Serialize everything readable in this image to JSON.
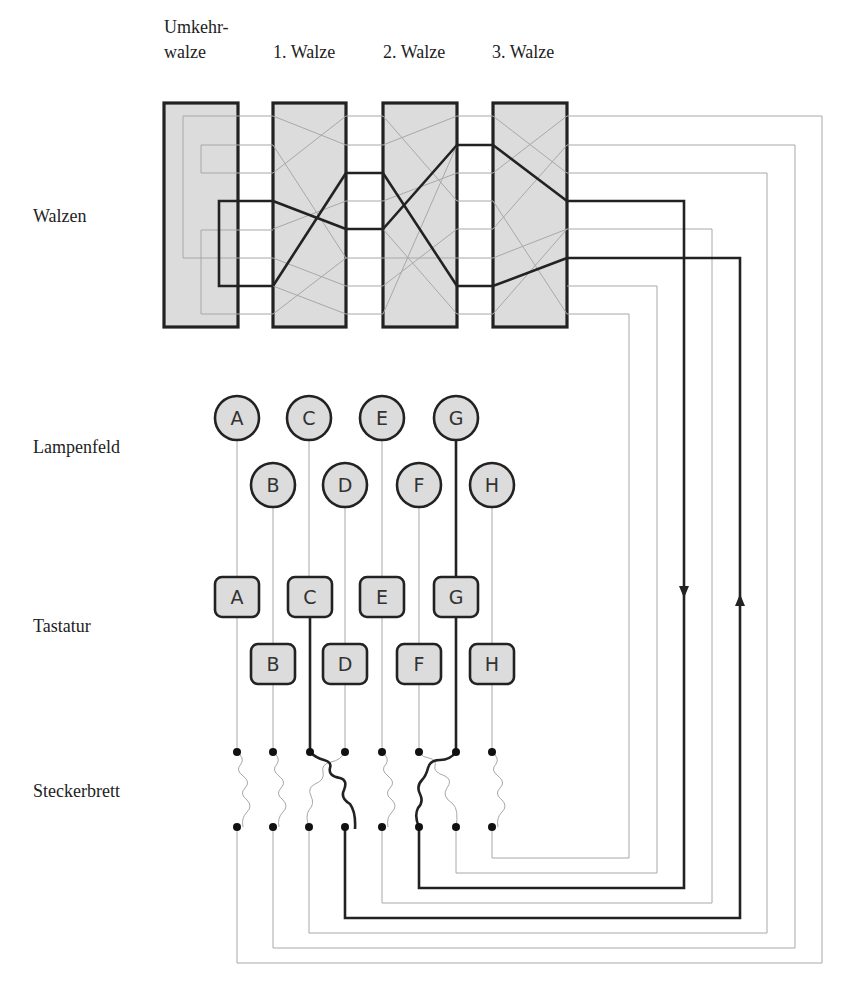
{
  "labels": {
    "reflector_line1": "Umkehr-",
    "reflector_line2": "walze",
    "rotor1": "1. Walze",
    "rotor2": "2. Walze",
    "rotor3": "3. Walze",
    "row_walzen": "Walzen",
    "row_lampenfeld": "Lampenfeld",
    "row_tastatur": "Tastatur",
    "row_steckerbrett": "Steckerbrett"
  },
  "lamps": [
    {
      "letter": "A",
      "lit": false
    },
    {
      "letter": "B",
      "lit": false
    },
    {
      "letter": "C",
      "lit": false
    },
    {
      "letter": "D",
      "lit": false
    },
    {
      "letter": "E",
      "lit": false
    },
    {
      "letter": "F",
      "lit": false
    },
    {
      "letter": "G",
      "lit": true
    },
    {
      "letter": "H",
      "lit": false
    }
  ],
  "keys": [
    {
      "letter": "A",
      "pressed": false
    },
    {
      "letter": "B",
      "pressed": false
    },
    {
      "letter": "C",
      "pressed": true
    },
    {
      "letter": "D",
      "pressed": false
    },
    {
      "letter": "E",
      "pressed": false
    },
    {
      "letter": "F",
      "pressed": false
    },
    {
      "letter": "G",
      "pressed": false
    },
    {
      "letter": "H",
      "pressed": false
    }
  ],
  "plugboard_swaps": [
    [
      "C",
      "D"
    ],
    [
      "F",
      "G"
    ]
  ],
  "signal_path": [
    "C key",
    "Steckerbrett C→D",
    "3. Walze",
    "2. Walze",
    "1. Walze",
    "Umkehrwalze",
    "1. Walze",
    "2. Walze",
    "3. Walze",
    "Steckerbrett F→G",
    "G lamp"
  ],
  "colors": {
    "box_fill": "#dcdcdc",
    "stroke_dark": "#222222",
    "wire_thin": "#a8a8a8",
    "background": "#ffffff"
  }
}
